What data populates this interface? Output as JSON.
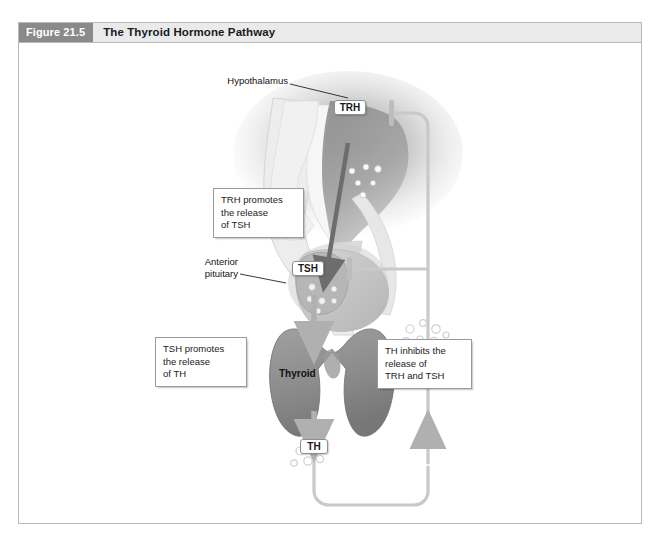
{
  "figure": {
    "number": "Figure 21.5",
    "title": "The Thyroid Hormone Pathway"
  },
  "labels": {
    "hypothalamus": "Hypothalamus",
    "anterior_pituitary": "Anterior\npituitary",
    "thyroid": "Thyroid"
  },
  "hormones": {
    "trh": "TRH",
    "tsh": "TSH",
    "th": "TH"
  },
  "callouts": {
    "trh_promotes": "TRH promotes\nthe release\nof TSH",
    "tsh_promotes": "TSH promotes\nthe release\nof TH",
    "th_inhibits": "TH inhibits the\nrelease of\nTRH and TSH"
  },
  "colors": {
    "figure_number_bg": "#8a8a8a",
    "figure_title_bg": "#eaeaea",
    "frame_border": "#b9b9b9",
    "brain_fill": "#e2e2e2",
    "hypothalamus_fill": "#8f8f8f",
    "pituitary_fill": "#c8c8c8",
    "thyroid_fill": "#8e8e8e",
    "arrow_gray": "#b0b0b0",
    "dark_arrow": "#6e6e6e",
    "feedback_line": "#c4c4c4"
  }
}
